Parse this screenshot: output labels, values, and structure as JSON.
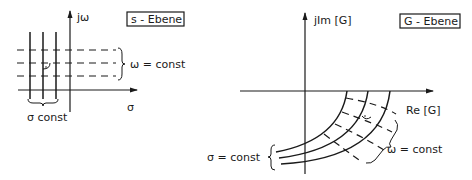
{
  "s_plane": {
    "title": "s - Ebene",
    "vertical_axis_label": "jω",
    "horizontal_axis_label": "σ",
    "omega_brace_label": "ω = const",
    "sigma_brace_label": "σ const"
  },
  "g_plane": {
    "title": "G - Ebene",
    "vertical_axis_label": "jIm [G]",
    "horizontal_axis_label": "Re [G]",
    "sigma_brace_label": "σ = const",
    "omega_brace_label": "ω = const"
  },
  "colors": {
    "ink": "#1a1a1a",
    "background": "#ffffff"
  }
}
